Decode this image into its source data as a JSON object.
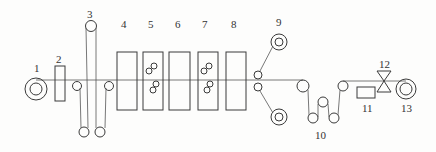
{
  "diagram": {
    "type": "process-line schematic",
    "line_color": "#3a3a3a",
    "labels": {
      "n1": "1",
      "n2": "2",
      "n3": "3",
      "n4": "4",
      "n5": "5",
      "n6": "6",
      "n7": "7",
      "n8": "8",
      "n9": "9",
      "n10": "10",
      "n11": "11",
      "n12": "12",
      "n13": "13"
    },
    "components": [
      {
        "id": "1",
        "shape": "unwind-reel"
      },
      {
        "id": "2",
        "shape": "rectangle"
      },
      {
        "id": "3",
        "shape": "festoon-rollers"
      },
      {
        "id": "4",
        "shape": "tank"
      },
      {
        "id": "5",
        "shape": "tank-with-rollers"
      },
      {
        "id": "6",
        "shape": "tank"
      },
      {
        "id": "7",
        "shape": "tank-with-rollers"
      },
      {
        "id": "8",
        "shape": "tank"
      },
      {
        "id": "9",
        "shape": "twin-reels"
      },
      {
        "id": "10",
        "shape": "dancer-rollers"
      },
      {
        "id": "11",
        "shape": "rectangle"
      },
      {
        "id": "12",
        "shape": "cutter"
      },
      {
        "id": "13",
        "shape": "rewind-reel"
      }
    ]
  }
}
